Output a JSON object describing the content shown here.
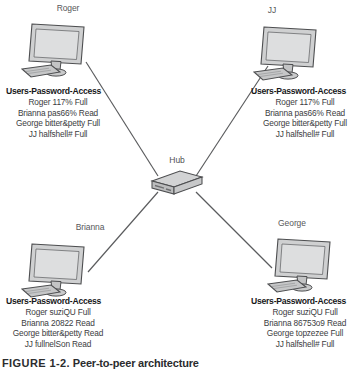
{
  "diagram": {
    "hub": {
      "label": "Hub",
      "icon": "network-hub-icon"
    },
    "credential_table_title": "Users-Password-Access",
    "nodes": [
      {
        "id": "roger",
        "label": "Roger",
        "icon": "desktop-computer-icon",
        "credentials": [
          "Roger 117% Full",
          "Brianna pas66% Read",
          "George bitter&petty Full",
          "JJ halfshell# Full"
        ]
      },
      {
        "id": "jj",
        "label": "JJ",
        "icon": "desktop-computer-icon",
        "credentials": [
          "Roger 117% Full",
          "Brianna pas66% Read",
          "George bitter&petty Full",
          "JJ halfshell# Full"
        ]
      },
      {
        "id": "brianna",
        "label": "Brianna",
        "icon": "desktop-computer-icon",
        "credentials": [
          "Roger suziQU Full",
          "Brianna 20822 Read",
          "George bitter&petty Read",
          "JJ fullnelSon Read"
        ]
      },
      {
        "id": "george",
        "label": "George",
        "icon": "desktop-computer-icon",
        "credentials": [
          "Roger suziQU Full",
          "Brianna 86753o9 Read",
          "George topzezee Full",
          "JJ halfshell# Full"
        ]
      }
    ]
  },
  "caption": {
    "figure_number": "FIGURE 1-2.",
    "text": "Peer-to-peer architecture"
  },
  "colors": {
    "line": "#5a5b5d",
    "screen_fill": "#d8d9da",
    "device_fill": "#c8c9ca",
    "text": "#3b3c3e",
    "title_text": "#17181a"
  }
}
